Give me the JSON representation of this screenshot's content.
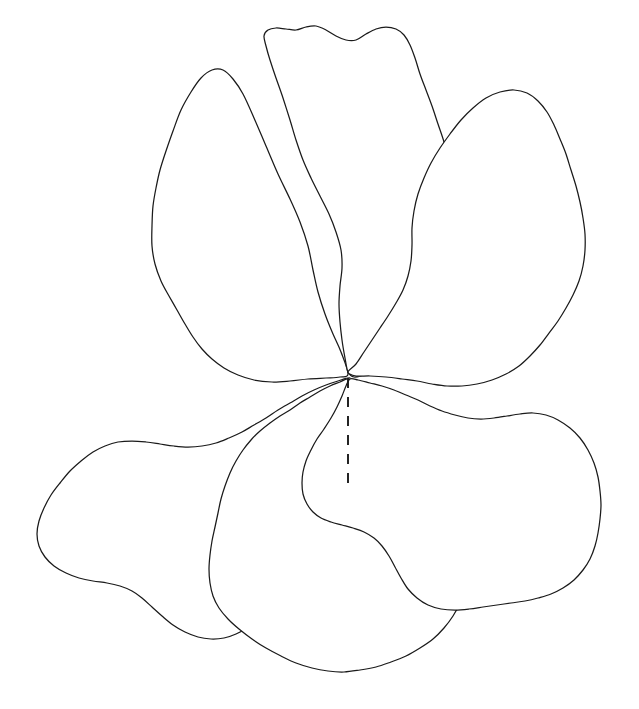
{
  "figure": {
    "title": "",
    "background_color": "#ffffff",
    "stroke_color": "#1a1a1a",
    "stroke_width": 1.25,
    "width": 639,
    "height": 709
  },
  "flower": {
    "petal_count": 5,
    "center": {
      "x": 348,
      "y": 376
    },
    "petals": [
      {
        "name": "upper-left-petal",
        "position": "upper-left",
        "path": "M348,374 C342,360 336,345 331,330 C325,312 320,296 316,280 C312,262 311,244 309,226 C306,206 302,186 295,167 C288,147 279,128 268,112 C257,96 244,82 230,74 C217,67 204,66 195,73 C186,81 180,93 175,107 C170,121 166,136 162,150 C158,164 155,178 152,192 C149,206 148,220 151,234 C153,246 159,256 165,265 C172,275 179,285 185,296 C191,307 196,318 202,329 C209,341 217,352 226,361 C236,371 248,378 261,382 C275,386 290,387 304,385 C317,383 330,380 339,377 C344,376 347,375 348,374 Z"
      },
      {
        "name": "upper-middle-petal",
        "position": "upper-middle",
        "path": "M348,374 C345,360 343,345 342,330 C341,312 340,295 339,278 C338,262 338,246 340,231 C341,216 341,201 337,187 C333,172 326,159 318,147 C310,135 301,124 292,113 C284,103 276,92 270,81 C265,71 262,60 261,50 C261,40 264,32 271,27 C279,22 288,23 296,26 C304,29 311,34 317,39 C323,44 329,48 336,49 C343,50 349,47 355,43 C361,39 367,33 374,30 C381,27 389,26 396,29 C403,32 408,38 412,46 C416,54 419,63 423,72 C427,82 433,91 438,101 C444,112 449,123 452,135 C455,148 455,161 452,174 C449,187 444,199 440,212 C436,225 433,238 432,251 C431,264 431,277 429,290 C427,303 424,316 419,328 C414,340 407,351 399,360 C391,369 382,375 373,378 C365,381 357,380 352,377 C349,376 348,375 348,374 Z"
      },
      {
        "name": "upper-right-petal",
        "position": "upper-right",
        "path": "M348,374 C356,363 364,352 371,341 C378,329 385,317 392,306 C399,294 406,283 410,270 C414,258 415,245 415,232 C415,218 414,205 416,192 C418,180 422,168 428,157 C434,146 442,136 450,126 C459,116 468,107 478,100 C489,92 501,88 513,89 C524,90 534,95 542,103 C550,111 556,121 561,132 C566,143 570,155 573,167 C576,179 579,191 582,203 C585,216 587,229 585,242 C583,256 577,268 570,279 C563,291 555,302 548,313 C541,325 534,336 527,347 C520,358 512,368 502,375 C492,382 480,386 468,387 C455,388 442,386 429,383 C416,381 403,379 390,378 C377,377 365,377 357,376 C351,375 348,375 348,374 Z"
      },
      {
        "name": "lower-left-petal",
        "position": "lower-left",
        "path": "M348,377 C337,379 326,381 315,384 C302,387 290,392 278,398 C265,405 253,413 241,420 C229,428 217,435 204,439 C192,443 179,444 166,442 C153,440 140,437 127,437 C114,437 101,440 90,447 C78,454 68,464 59,475 C50,487 42,499 38,512 C34,526 35,541 41,553 C47,565 57,574 68,580 C79,586 91,589 103,589 C115,589 127,586 138,589 C148,592 156,599 164,607 C173,616 181,625 192,631 C203,637 215,639 227,637 C239,635 250,630 260,623 C269,617 278,609 286,601 C294,593 301,584 207,0 Z"
      },
      {
        "name": "lower-middle-petal",
        "position": "lower-middle",
        "path": "M348,377 C340,379 332,382 324,386 C314,391 304,397 294,403 C284,409 274,415 264,421 C254,428 245,436 238,446 C231,456 226,467 222,479 C218,491 215,503 212,516 C209,529 206,542 204,555 C202,569 202,583 206,596 C210,609 218,620 227,630 C237,640 248,649 260,656 C273,663 286,668 300,670 C315,672 330,672 344,670 C359,668 373,664 386,658 C400,652 413,644 424,634 C436,624 446,612 453,599 C461,585 465,570 467,555 C469,539 469,523 468,507 C467,492 465,477 463,462 C461,447 458,433 452,420 C446,408 437,398 427,390 C417,383 406,378 395,376 C384,374 373,374 364,375 C356,376 350,377 348,377 Z"
      },
      {
        "name": "lower-right-petal",
        "position": "lower-right",
        "path": "M348,377 C359,379 370,381 381,384 C393,387 405,391 416,396 C428,402 439,409 451,414 C463,419 476,422 489,421 C501,420 513,417 525,415 C538,413 551,413 563,418 C575,423 585,432 592,443 C598,454 601,466 601,479 C601,492 600,505 599,518 C598,531 597,544 594,557 C591,570 585,581 577,590 C568,600 557,607 545,611 C533,615 521,617 508,618 C495,619 482,620 469,621 C456,622 444,622 432,619 C421,616 411,611 403,603 C395,596 389,586 384,576 C379,566 374,557 366,550 C358,543 348,539 338,536 C328,533 318,531 310,526 C303,522 298,515 296,507 C294,499 295,490 297,481 C299,472 303,463 308,454 C313,445 319,437 325,428 C331,419 337,409 341,399 C345,390 347,382 348,377 Z"
      }
    ],
    "axis": {
      "name": "center-axis-dashed-line",
      "x": 348,
      "y_start": 378,
      "y_end": 486,
      "style": "dashed",
      "dash_pattern": "10 9"
    }
  }
}
